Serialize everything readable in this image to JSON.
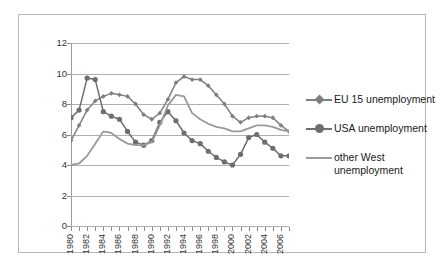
{
  "chart_data": {
    "type": "line",
    "title": "",
    "subtitle": "",
    "xlabel": "",
    "ylabel": "",
    "xlim": [
      1980,
      2007
    ],
    "ylim": [
      0,
      12
    ],
    "y_ticks": [
      0,
      2,
      4,
      6,
      8,
      10,
      12
    ],
    "grid": true,
    "legend_position": "right",
    "x": [
      1980,
      1981,
      1982,
      1983,
      1984,
      1985,
      1986,
      1987,
      1988,
      1989,
      1990,
      1991,
      1992,
      1993,
      1994,
      1995,
      1996,
      1997,
      1998,
      1999,
      2000,
      2001,
      2002,
      2003,
      2004,
      2005,
      2006,
      2007
    ],
    "x_tick_labels": [
      "1980",
      "1982",
      "1984",
      "1986",
      "1988",
      "1990",
      "1992",
      "1994",
      "1996",
      "1998",
      "2000",
      "2002",
      "2004",
      "2006"
    ],
    "series": [
      {
        "name": "EU 15 unemployment",
        "color": "#808080",
        "marker": "diamond",
        "values": [
          5.6,
          6.6,
          7.6,
          8.2,
          8.5,
          8.7,
          8.6,
          8.5,
          8.0,
          7.3,
          7.0,
          7.4,
          8.3,
          9.4,
          9.8,
          9.6,
          9.6,
          9.2,
          8.6,
          8.0,
          7.2,
          6.8,
          7.1,
          7.2,
          7.2,
          7.1,
          6.6,
          6.2
        ]
      },
      {
        "name": "USA unemployment",
        "color": "#6e6e6e",
        "marker": "circle",
        "values": [
          7.1,
          7.6,
          9.7,
          9.6,
          7.5,
          7.2,
          7.0,
          6.2,
          5.5,
          5.3,
          5.6,
          6.8,
          7.5,
          6.9,
          6.1,
          5.6,
          5.4,
          4.9,
          4.5,
          4.2,
          4.0,
          4.7,
          5.8,
          6.0,
          5.5,
          5.1,
          4.6,
          4.6
        ]
      },
      {
        "name": "other West unemployment",
        "color": "#9a9a9a",
        "marker": "none",
        "values": [
          4.0,
          4.1,
          4.6,
          5.4,
          6.2,
          6.1,
          5.7,
          5.4,
          5.3,
          5.3,
          5.5,
          6.6,
          7.9,
          8.6,
          8.5,
          7.4,
          7.0,
          6.7,
          6.5,
          6.4,
          6.2,
          6.2,
          6.4,
          6.6,
          6.6,
          6.5,
          6.3,
          6.2
        ]
      }
    ]
  },
  "legend": {
    "items": [
      {
        "label": "EU 15 unemployment"
      },
      {
        "label": "USA unemployment"
      },
      {
        "label": "other West unemployment"
      }
    ]
  }
}
